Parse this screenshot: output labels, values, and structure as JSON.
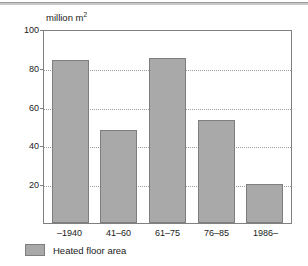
{
  "chart_data": {
    "type": "bar",
    "title": "",
    "subtitle": "",
    "unit_label": "million m",
    "unit_label_sup": "2",
    "xlabel": "",
    "ylabel": "million m2",
    "categories": [
      "–1940",
      "41–60",
      "61–75",
      "76–85",
      "1986–"
    ],
    "values": [
      84,
      48,
      85,
      53,
      20
    ],
    "ylim": [
      0,
      100
    ],
    "yticks": [
      100,
      80,
      60,
      40,
      20
    ],
    "ytick_labels": [
      "100",
      "80",
      "60",
      "40",
      "20"
    ],
    "grid": true,
    "grid_style": "dotted-horizontal",
    "legend": {
      "position": "bottom-left",
      "entries": [
        {
          "label": "Heated floor area",
          "color": "#a9a9a9"
        }
      ]
    },
    "series": [
      {
        "name": "Heated floor area",
        "color": "#a9a9a9",
        "border_color": "#7e7e7e",
        "values": [
          84,
          48,
          85,
          53,
          20
        ]
      }
    ],
    "colors": {
      "bar_fill": "#a9a9a9",
      "bar_border": "#7e7e7e",
      "grid": "#9d9d9d",
      "axis": "#808080",
      "text": "#1a1a1a",
      "background": "#ffffff",
      "top_rule": "#9a9a9a"
    }
  }
}
